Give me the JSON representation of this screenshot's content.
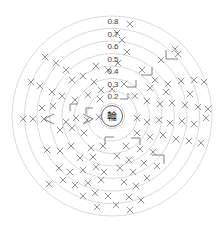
{
  "chart_data": {
    "type": "scatter",
    "plot_style": "polar-concentric-rings",
    "title": "",
    "subtitle": "",
    "xlabel": "",
    "ylabel": "",
    "center_label": "輪",
    "grid": true,
    "legend": false,
    "legend_position": "none",
    "rlim": [
      0,
      0.8
    ],
    "radial_tick_labels": [
      "0.8",
      "0.7",
      "0.6",
      "0.5",
      "0.4",
      "0.3",
      "0.2",
      "0.1"
    ],
    "radial_tick_values": [
      0.8,
      0.7,
      0.6,
      0.5,
      0.4,
      0.3,
      0.2,
      0.1
    ],
    "ring_count": 8,
    "ring_radii_px": [
      100,
      87.5,
      75,
      62.5,
      50,
      37.5,
      25,
      12.5
    ],
    "center_px": [
      112,
      116
    ],
    "marker_symbol": "x",
    "marker_color": "#7d7d88",
    "grid_color": "#c9c9cf",
    "label_color": "#3a3a3a",
    "background_color": "#ffffff",
    "points": [
      {
        "x": 130,
        "y": 24
      },
      {
        "x": 117,
        "y": 33
      },
      {
        "x": 122,
        "y": 40
      },
      {
        "x": 175,
        "y": 49
      },
      {
        "x": 161,
        "y": 60
      },
      {
        "x": 45,
        "y": 57
      },
      {
        "x": 56,
        "y": 63
      },
      {
        "x": 66,
        "y": 70
      },
      {
        "x": 127,
        "y": 52
      },
      {
        "x": 142,
        "y": 70
      },
      {
        "x": 31,
        "y": 82
      },
      {
        "x": 40,
        "y": 86
      },
      {
        "x": 72,
        "y": 80
      },
      {
        "x": 83,
        "y": 76
      },
      {
        "x": 94,
        "y": 82
      },
      {
        "x": 155,
        "y": 80
      },
      {
        "x": 168,
        "y": 84
      },
      {
        "x": 181,
        "y": 81
      },
      {
        "x": 194,
        "y": 80
      },
      {
        "x": 204,
        "y": 82
      },
      {
        "x": 52,
        "y": 92
      },
      {
        "x": 62,
        "y": 96
      },
      {
        "x": 75,
        "y": 100
      },
      {
        "x": 88,
        "y": 95
      },
      {
        "x": 100,
        "y": 99
      },
      {
        "x": 135,
        "y": 96
      },
      {
        "x": 147,
        "y": 101
      },
      {
        "x": 160,
        "y": 104
      },
      {
        "x": 172,
        "y": 103
      },
      {
        "x": 185,
        "y": 105
      },
      {
        "x": 198,
        "y": 107
      },
      {
        "x": 208,
        "y": 109
      },
      {
        "x": 23,
        "y": 119
      },
      {
        "x": 33,
        "y": 119
      },
      {
        "x": 44,
        "y": 119
      },
      {
        "x": 66,
        "y": 122
      },
      {
        "x": 76,
        "y": 118
      },
      {
        "x": 87,
        "y": 120
      },
      {
        "x": 99,
        "y": 117
      },
      {
        "x": 137,
        "y": 118
      },
      {
        "x": 147,
        "y": 122
      },
      {
        "x": 159,
        "y": 120
      },
      {
        "x": 170,
        "y": 123
      },
      {
        "x": 182,
        "y": 121
      },
      {
        "x": 194,
        "y": 124
      },
      {
        "x": 206,
        "y": 118
      },
      {
        "x": 60,
        "y": 130
      },
      {
        "x": 72,
        "y": 128
      },
      {
        "x": 84,
        "y": 133
      },
      {
        "x": 137,
        "y": 133
      },
      {
        "x": 150,
        "y": 137
      },
      {
        "x": 163,
        "y": 135
      },
      {
        "x": 176,
        "y": 139
      },
      {
        "x": 189,
        "y": 141
      },
      {
        "x": 201,
        "y": 143
      },
      {
        "x": 47,
        "y": 150
      },
      {
        "x": 60,
        "y": 151
      },
      {
        "x": 71,
        "y": 146
      },
      {
        "x": 91,
        "y": 148
      },
      {
        "x": 103,
        "y": 146
      },
      {
        "x": 126,
        "y": 146
      },
      {
        "x": 140,
        "y": 149
      },
      {
        "x": 153,
        "y": 152
      },
      {
        "x": 80,
        "y": 158
      },
      {
        "x": 93,
        "y": 157
      },
      {
        "x": 117,
        "y": 156
      },
      {
        "x": 129,
        "y": 160
      },
      {
        "x": 144,
        "y": 163
      },
      {
        "x": 157,
        "y": 166
      },
      {
        "x": 59,
        "y": 168
      },
      {
        "x": 70,
        "y": 172
      },
      {
        "x": 83,
        "y": 170
      },
      {
        "x": 96,
        "y": 167
      },
      {
        "x": 104,
        "y": 172
      },
      {
        "x": 120,
        "y": 168
      },
      {
        "x": 133,
        "y": 172
      },
      {
        "x": 147,
        "y": 178
      },
      {
        "x": 49,
        "y": 184
      },
      {
        "x": 63,
        "y": 180
      },
      {
        "x": 75,
        "y": 185
      },
      {
        "x": 88,
        "y": 183
      },
      {
        "x": 101,
        "y": 180
      },
      {
        "x": 124,
        "y": 182
      },
      {
        "x": 136,
        "y": 186
      },
      {
        "x": 83,
        "y": 196
      },
      {
        "x": 95,
        "y": 193
      },
      {
        "x": 108,
        "y": 196
      },
      {
        "x": 129,
        "y": 197
      },
      {
        "x": 141,
        "y": 200
      },
      {
        "x": 97,
        "y": 207
      },
      {
        "x": 116,
        "y": 205
      },
      {
        "x": 130,
        "y": 210
      },
      {
        "x": 178,
        "y": 54
      },
      {
        "x": 166,
        "y": 92
      },
      {
        "x": 190,
        "y": 94
      },
      {
        "x": 53,
        "y": 106
      },
      {
        "x": 42,
        "y": 108
      },
      {
        "x": 118,
        "y": 63
      },
      {
        "x": 108,
        "y": 70
      },
      {
        "x": 96,
        "y": 66
      },
      {
        "x": 150,
        "y": 88
      },
      {
        "x": 124,
        "y": 84
      },
      {
        "x": 112,
        "y": 89
      },
      {
        "x": 101,
        "y": 90
      }
    ],
    "brackets": [
      {
        "x": 166,
        "y": 50,
        "w": 12,
        "h": 9,
        "kind": "corner-br"
      },
      {
        "x": 141,
        "y": 67,
        "w": 11,
        "h": 8,
        "kind": "corner-bl"
      },
      {
        "x": 127,
        "y": 80,
        "w": 9,
        "h": 7,
        "kind": "corner-bl"
      },
      {
        "x": 120,
        "y": 93,
        "w": 8,
        "h": 6,
        "kind": "corner-bl"
      },
      {
        "x": 70,
        "y": 104,
        "w": 8,
        "h": 7,
        "kind": "corner-tr"
      },
      {
        "x": 86,
        "y": 108,
        "w": 7,
        "h": 6,
        "kind": "corner-tr"
      },
      {
        "x": 105,
        "y": 137,
        "w": 9,
        "h": 7,
        "kind": "corner-tr"
      },
      {
        "x": 131,
        "y": 138,
        "w": 9,
        "h": 7,
        "kind": "corner-tl"
      },
      {
        "x": 152,
        "y": 155,
        "w": 12,
        "h": 9,
        "kind": "corner-tl"
      },
      {
        "x": 44,
        "y": 114,
        "w": 10,
        "h": 10,
        "kind": "chevron-left"
      },
      {
        "x": 83,
        "y": 114,
        "w": 10,
        "h": 10,
        "kind": "chevron-right"
      }
    ]
  }
}
